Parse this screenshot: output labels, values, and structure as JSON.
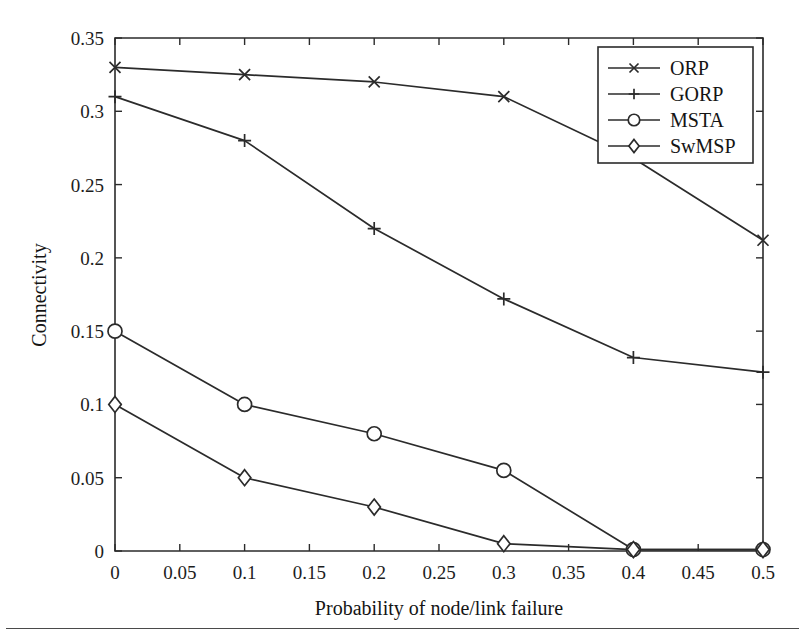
{
  "figure": {
    "background_color": "#ffffff",
    "ink_color": "#2b2b2b",
    "page_rule_present": "true"
  },
  "chart_data": {
    "type": "line",
    "title": "",
    "subtitle": "",
    "xlabel": "Probability of node/link failure",
    "ylabel": "Connectivity",
    "xlim": [
      0,
      0.5
    ],
    "ylim": [
      0,
      0.35
    ],
    "xticks": [
      0,
      0.05,
      0.1,
      0.15,
      0.2,
      0.25,
      0.3,
      0.35,
      0.4,
      0.45,
      0.5
    ],
    "yticks": [
      0,
      0.05,
      0.1,
      0.15,
      0.2,
      0.25,
      0.3,
      0.35
    ],
    "xtick_labels": [
      "0",
      "0.05",
      "0.1",
      "0.15",
      "0.2",
      "0.25",
      "0.3",
      "0.35",
      "0.4",
      "0.45",
      "0.5"
    ],
    "ytick_labels": [
      "0",
      "0.05",
      "0.1",
      "0.15",
      "0.2",
      "0.25",
      "0.3",
      "0.35"
    ],
    "grid": "off",
    "legend_position": "upper right inside",
    "x": [
      0,
      0.1,
      0.2,
      0.3,
      0.4,
      0.5
    ],
    "series": [
      {
        "name": "ORP",
        "marker": "x",
        "values": [
          0.33,
          0.325,
          0.32,
          0.31,
          0.268,
          0.212
        ]
      },
      {
        "name": "GORP",
        "marker": "plus",
        "values": [
          0.31,
          0.28,
          0.22,
          0.172,
          0.132,
          0.122
        ]
      },
      {
        "name": "MSTA",
        "marker": "circle",
        "values": [
          0.15,
          0.1,
          0.08,
          0.055,
          0.001,
          0.001
        ]
      },
      {
        "name": "SwMSP",
        "marker": "diamond",
        "values": [
          0.1,
          0.05,
          0.03,
          0.005,
          0.001,
          0.001
        ]
      }
    ]
  },
  "legend": {
    "entries": [
      {
        "label": "ORP",
        "marker": "x"
      },
      {
        "label": "GORP",
        "marker": "plus"
      },
      {
        "label": "MSTA",
        "marker": "circle"
      },
      {
        "label": "SwMSP",
        "marker": "diamond"
      }
    ]
  },
  "axis_titles": {
    "x": "Probability of node/link failure",
    "y": "Connectivity"
  }
}
